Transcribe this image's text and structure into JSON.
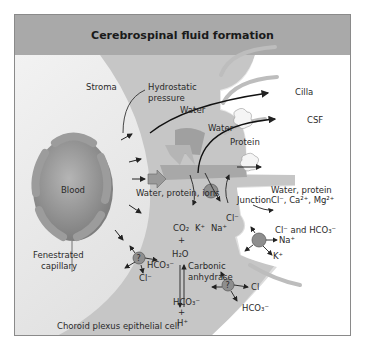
{
  "title": "Cerebrospinal fluid formation",
  "labels": {
    "stroma": "Stroma",
    "hydrostatic_1": "Hydrostatic",
    "hydrostatic_2": "pressure",
    "cilia": "Cilla",
    "csf": "CSF",
    "water_1": "Water",
    "water_2": "Water",
    "protein": "Protein",
    "blood": "Blood",
    "water_protein_ions": "Water, protein, ions",
    "junction": "Junction",
    "out_water_protein": "Water, protein",
    "out_ions": "Cl⁻, Ca²⁺, Mg²⁺",
    "co2": "CO₂",
    "k_in": "K⁺",
    "na_in": "Na⁺",
    "cl_in": "Cl⁻",
    "cl_hco3_out": "Cl⁻ and HCO₃⁻",
    "na_out": "Na⁺",
    "k_out": "K⁺",
    "plus_1": "+",
    "h2o": "H₂O",
    "carbonic_1": "Carbonic",
    "carbonic_2": "anhydrase",
    "hco3_mid": "HCO₃⁻",
    "plus_2": "+",
    "h_plus": "H⁺",
    "fenestrated_1": "Fenestrated",
    "fenestrated_2": "capillary",
    "hco3_left": "HCO₃⁻",
    "cl_left": "Cl⁻",
    "cl_right": "Cl",
    "hco3_right": "HCO₃⁻",
    "transporter_q": "?",
    "cell_label": "Choroid plexus epithelial cell"
  },
  "colors": {
    "title_bg": "#a9a9a9",
    "cell_fill": "#c8c8c8",
    "stroma_fill": "#e6e6e6",
    "blood_fill": "#8c8c8c",
    "cilia": "#bdbdbd"
  }
}
